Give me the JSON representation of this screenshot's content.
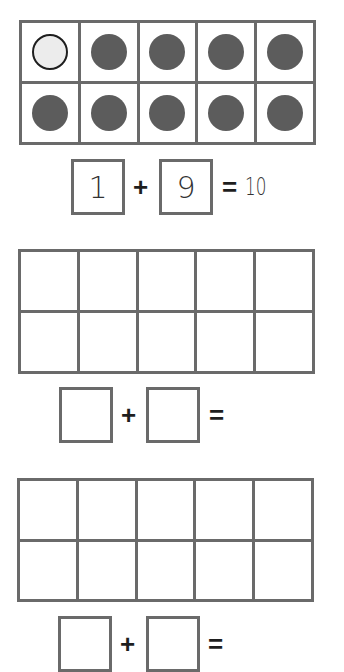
{
  "worksheet": {
    "problems": [
      {
        "ten_frame": {
          "rows": 2,
          "cols": 5,
          "cells": [
            "empty",
            "filled",
            "filled",
            "filled",
            "filled",
            "filled",
            "filled",
            "filled",
            "filled",
            "filled"
          ]
        },
        "equation": {
          "addend1": "1",
          "plus": "+",
          "addend2": "9",
          "equals": "=",
          "sum": "10"
        }
      },
      {
        "ten_frame": {
          "rows": 2,
          "cols": 5,
          "cells": [
            "blank",
            "blank",
            "blank",
            "blank",
            "blank",
            "blank",
            "blank",
            "blank",
            "blank",
            "blank"
          ]
        },
        "equation": {
          "addend1": "",
          "plus": "+",
          "addend2": "",
          "equals": "=",
          "sum": ""
        }
      },
      {
        "ten_frame": {
          "rows": 2,
          "cols": 5,
          "cells": [
            "blank",
            "blank",
            "blank",
            "blank",
            "blank",
            "blank",
            "blank",
            "blank",
            "blank",
            "blank"
          ]
        },
        "equation": {
          "addend1": "",
          "plus": "+",
          "addend2": "",
          "equals": "=",
          "sum": ""
        }
      }
    ],
    "colors": {
      "frame_border": "#6a6a6a",
      "filled_counter": "#5c5c5c",
      "empty_counter": "#ececec",
      "empty_counter_outline": "#1e1e1e"
    }
  }
}
